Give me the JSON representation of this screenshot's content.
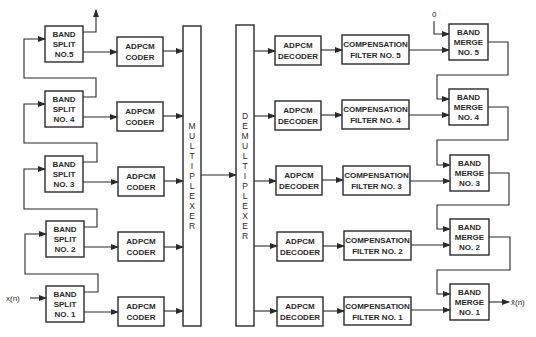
{
  "diagram": {
    "type": "subband ADPCM codec block diagram",
    "input_label": "x(n)",
    "output_label": "x̂(n)",
    "merge_seed_label": "0",
    "multiplexer_label": "MULTIPLEXER",
    "demultiplexer_label": "DEMULTIPLEXER",
    "band_split": [
      {
        "line1": "BAND",
        "line2": "SPLIT",
        "line3": "NO.5"
      },
      {
        "line1": "BAND",
        "line2": "SPLIT",
        "line3": "NO. 4"
      },
      {
        "line1": "BAND",
        "line2": "SPLIT",
        "line3": "NO. 3"
      },
      {
        "line1": "BAND",
        "line2": "SPLIT",
        "line3": "NO. 2"
      },
      {
        "line1": "BAND",
        "line2": "SPLIT",
        "line3": "NO. 1"
      }
    ],
    "coders": [
      {
        "line1": "ADPCM",
        "line2": "CODER"
      },
      {
        "line1": "ADPCM",
        "line2": "CODER"
      },
      {
        "line1": "ADPCM",
        "line2": "CODER"
      },
      {
        "line1": "ADPCM",
        "line2": "CODER"
      },
      {
        "line1": "ADPCM",
        "line2": "CODER"
      }
    ],
    "decoders": [
      {
        "line1": "ADPCM",
        "line2": "DECODER"
      },
      {
        "line1": "ADPCM",
        "line2": "DECODER"
      },
      {
        "line1": "ADPCM",
        "line2": "DECODER"
      },
      {
        "line1": "ADPCM",
        "line2": "DECODER"
      },
      {
        "line1": "ADPCM",
        "line2": "DECODER"
      }
    ],
    "compensation_filters": [
      {
        "line1": "COMPENSATION",
        "line2": "FILTER NO. 5"
      },
      {
        "line1": "COMPENSATION",
        "line2": "FILTER NO. 4"
      },
      {
        "line1": "COMPENSATION",
        "line2": "FILTER NO. 3"
      },
      {
        "line1": "COMPENSATION",
        "line2": "FILTER NO. 2"
      },
      {
        "line1": "COMPENSATION",
        "line2": "FILTER NO. 1"
      }
    ],
    "band_merge": [
      {
        "line1": "BAND",
        "line2": "MERGE",
        "line3": "NO. 5"
      },
      {
        "line1": "BAND",
        "line2": "MERGE",
        "line3": "NO. 4"
      },
      {
        "line1": "BAND",
        "line2": "MERGE",
        "line3": "NO. 3"
      },
      {
        "line1": "BAND",
        "line2": "MERGE",
        "line3": "NO. 2"
      },
      {
        "line1": "BAND",
        "line2": "MERGE",
        "line3": "NO. 1"
      }
    ],
    "colors": {
      "ink": "#2a2a2a",
      "background": "#ffffff"
    }
  }
}
